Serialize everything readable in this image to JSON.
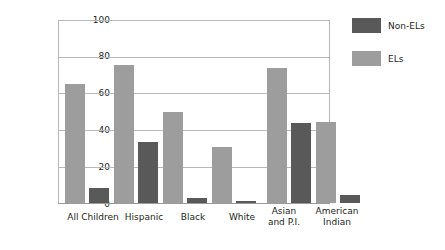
{
  "chart_data": {
    "type": "bar",
    "title": "",
    "xlabel": "",
    "ylabel": "Percentage",
    "ylim": [
      0,
      100
    ],
    "yticks": [
      0,
      20,
      40,
      60,
      80,
      100
    ],
    "ytick_labels": [
      "0",
      "20",
      "40",
      "60",
      "80",
      "100"
    ],
    "grid": true,
    "grid_axis": "y",
    "legend_position": "right",
    "categories": [
      "All Children",
      "Hispanic",
      "Black",
      "White",
      "Asian\nand P.I.",
      "American\nIndian"
    ],
    "series": [
      {
        "name": "ELs",
        "color": "#9d9d9d",
        "values": [
          65,
          75.5,
          50,
          30.5,
          74,
          44.5
        ]
      },
      {
        "name": "Non-ELs",
        "color": "#595959",
        "values": [
          8,
          33.5,
          3,
          1,
          43.5,
          4.5
        ]
      }
    ],
    "series_draw_order": [
      "ELs",
      "Non-ELs"
    ],
    "legend_display_order": [
      "Non-ELs",
      "ELs"
    ]
  },
  "legend": {
    "items": [
      {
        "label": "Non-ELs",
        "swatch": "dark-gray-swatch"
      },
      {
        "label": "ELs",
        "swatch": "light-gray-swatch"
      }
    ]
  },
  "axes": {
    "y_title": "Percentage",
    "y_labels": [
      "100",
      "80",
      "60",
      "40",
      "20",
      "0"
    ]
  }
}
